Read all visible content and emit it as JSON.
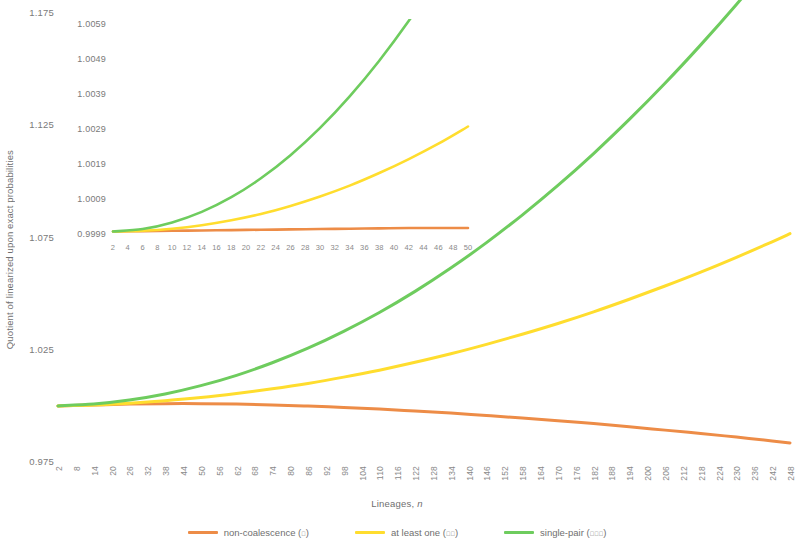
{
  "axis": {
    "y_title": "Quotient of linearized upon exact probabilities",
    "x_title_text": "Lineages, ",
    "x_title_symbol": "n"
  },
  "legend": {
    "items": [
      {
        "label": "non-coalescence (",
        "roman": "ɪ",
        "close": ")",
        "color": "#ED8C47",
        "name": "non-coalescence"
      },
      {
        "label": "at least one (",
        "roman": "ɪɪ",
        "close": ")",
        "color": "#FFDD2E",
        "name": "at-least-one"
      },
      {
        "label": "single-pair (",
        "roman": "ɪɪɪ",
        "close": ")",
        "color": "#6ECC5E",
        "name": "single-pair"
      }
    ]
  },
  "colors": {
    "non_coalescence": "#ED8C47",
    "at_least_one": "#FFDD2E",
    "single_pair": "#6ECC5E",
    "text": "#7a7a7a"
  },
  "chart_data": {
    "type": "line",
    "title": "",
    "xlabel": "Lineages, n",
    "ylabel": "Quotient of linearized upon exact probabilities",
    "xlim": [
      2,
      248
    ],
    "ylim": [
      0.975,
      1.175
    ],
    "ytick_labels": [
      "1.175",
      "1.125",
      "1.075",
      "1.025",
      "0.975"
    ],
    "ytick_values": [
      1.175,
      1.125,
      1.075,
      1.025,
      0.975
    ],
    "xtick_labels": [
      "2",
      "8",
      "14",
      "20",
      "26",
      "32",
      "38",
      "44",
      "50",
      "56",
      "62",
      "68",
      "74",
      "80",
      "86",
      "92",
      "98",
      "104",
      "110",
      "116",
      "122",
      "128",
      "134",
      "140",
      "146",
      "152",
      "158",
      "164",
      "170",
      "176",
      "182",
      "188",
      "194",
      "200",
      "206",
      "212",
      "218",
      "224",
      "230",
      "236",
      "242",
      "248"
    ],
    "xtick_values": [
      2,
      8,
      14,
      20,
      26,
      32,
      38,
      44,
      50,
      56,
      62,
      68,
      74,
      80,
      86,
      92,
      98,
      104,
      110,
      116,
      122,
      128,
      134,
      140,
      146,
      152,
      158,
      164,
      170,
      176,
      182,
      188,
      194,
      200,
      206,
      212,
      218,
      224,
      230,
      236,
      242,
      248
    ],
    "grid": false,
    "legend_position": "bottom",
    "series": [
      {
        "name": "non-coalescence (ɪ)",
        "color": "#ED8C47",
        "x": [
          2,
          14,
          26,
          38,
          50,
          62,
          74,
          86,
          98,
          110,
          122,
          134,
          146,
          158,
          170,
          182,
          194,
          206,
          218,
          230,
          242,
          248
        ],
        "values": [
          1.0,
          1.0004,
          1.0008,
          1.001,
          1.001,
          1.0008,
          1.0004,
          0.9999,
          0.9993,
          0.9986,
          0.9977,
          0.9968,
          0.9957,
          0.9946,
          0.9934,
          0.9921,
          0.9907,
          0.9892,
          0.9877,
          0.9861,
          0.9844,
          0.9835
        ]
      },
      {
        "name": "at least one (ɪɪ)",
        "color": "#FFDD2E",
        "x": [
          2,
          14,
          26,
          38,
          50,
          62,
          74,
          86,
          98,
          110,
          122,
          134,
          146,
          158,
          170,
          182,
          194,
          206,
          218,
          230,
          242,
          248
        ],
        "values": [
          1.0,
          1.0004,
          1.0012,
          1.0023,
          1.0037,
          1.0055,
          1.0076,
          1.01,
          1.0128,
          1.0159,
          1.0194,
          1.0232,
          1.0274,
          1.0319,
          1.0367,
          1.0419,
          1.0475,
          1.0534,
          1.0596,
          1.0662,
          1.0731,
          1.0767
        ]
      },
      {
        "name": "single-pair (ɪɪɪ)",
        "color": "#6ECC5E",
        "x": [
          2,
          14,
          26,
          38,
          50,
          62,
          74,
          86,
          98,
          110,
          122,
          134,
          146,
          158,
          170,
          182,
          194,
          206,
          218,
          230,
          242,
          248
        ],
        "values": [
          1.0,
          1.0008,
          1.0026,
          1.0053,
          1.009,
          1.0136,
          1.0192,
          1.0257,
          1.0332,
          1.0416,
          1.051,
          1.0614,
          1.0727,
          1.085,
          1.0982,
          1.1124,
          1.1276,
          1.1437,
          1.1608,
          1.1788,
          1.1978,
          1.2077
        ]
      }
    ],
    "inset": {
      "type": "line",
      "xlim": [
        2,
        50
      ],
      "ylim": [
        0.9999,
        1.0059
      ],
      "ytick_labels": [
        "1.0059",
        "1.0049",
        "1.0039",
        "1.0029",
        "1.0019",
        "1.0009",
        "0.9999"
      ],
      "ytick_values": [
        1.0059,
        1.0049,
        1.0039,
        1.0029,
        1.0019,
        1.0009,
        0.9999
      ],
      "xtick_labels": [
        "2",
        "4",
        "6",
        "8",
        "10",
        "12",
        "14",
        "16",
        "18",
        "20",
        "22",
        "24",
        "26",
        "28",
        "30",
        "32",
        "34",
        "36",
        "38",
        "40",
        "42",
        "44",
        "46",
        "48",
        "50"
      ],
      "xtick_values": [
        2,
        4,
        6,
        8,
        10,
        12,
        14,
        16,
        18,
        20,
        22,
        24,
        26,
        28,
        30,
        32,
        34,
        36,
        38,
        40,
        42,
        44,
        46,
        48,
        50
      ],
      "grid": false,
      "series": [
        {
          "name": "non-coalescence (ɪ)",
          "color": "#ED8C47",
          "x": [
            2,
            6,
            10,
            14,
            18,
            22,
            26,
            30,
            34,
            38,
            42,
            46,
            50
          ],
          "values": [
            1.0,
            1.00001,
            1.00002,
            1.00003,
            1.00004,
            1.00005,
            1.00006,
            1.00007,
            1.00008,
            1.00009,
            1.0001,
            1.0001,
            1.0001
          ]
        },
        {
          "name": "at least one (ɪɪ)",
          "color": "#FFDD2E",
          "x": [
            2,
            6,
            10,
            14,
            18,
            22,
            26,
            30,
            34,
            38,
            42,
            46,
            50
          ],
          "values": [
            1.0,
            1.00002,
            1.00008,
            1.00018,
            1.00032,
            1.0005,
            1.00073,
            1.001,
            1.00131,
            1.00167,
            1.00207,
            1.00251,
            1.003
          ]
        },
        {
          "name": "single-pair (ɪɪɪ)",
          "color": "#6ECC5E",
          "x": [
            2,
            6,
            10,
            14,
            18,
            22,
            26,
            30,
            34,
            38,
            42,
            46,
            50
          ],
          "values": [
            1.0,
            1.00007,
            1.00026,
            1.00056,
            1.00098,
            1.00152,
            1.00218,
            1.00296,
            1.00386,
            1.00488,
            1.00602,
            1.00728,
            1.00866
          ]
        }
      ]
    }
  }
}
